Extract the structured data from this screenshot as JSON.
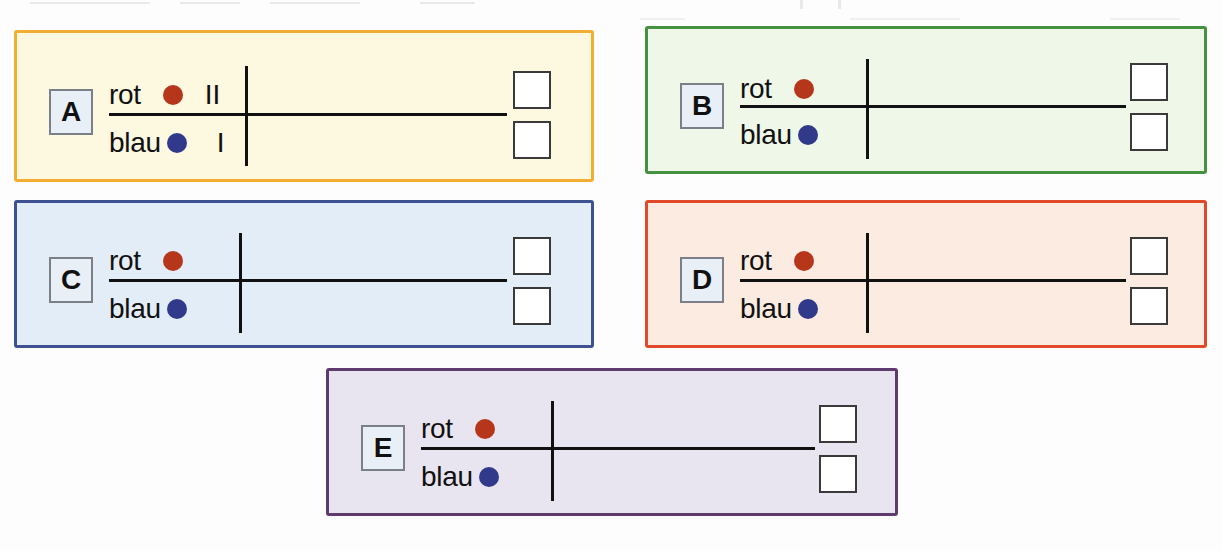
{
  "worksheet": {
    "row_labels": {
      "top": "rot",
      "bottom": "blau"
    },
    "dot_colors": {
      "red": "#b5361a",
      "blue": "#313a8a"
    },
    "panels": [
      {
        "id": "A",
        "letter": "A",
        "border_color": "#f1ae33",
        "fill_color": "#fdf8e0",
        "top_label": "rot",
        "bottom_label": "blau",
        "top_dot": "red",
        "bottom_dot": "blue",
        "top_numeral": "II",
        "bottom_numeral": "I",
        "checkbox_count": 2
      },
      {
        "id": "B",
        "letter": "B",
        "border_color": "#44913f",
        "fill_color": "#eef7e8",
        "top_label": "rot",
        "bottom_label": "blau",
        "top_dot": "red",
        "bottom_dot": "blue",
        "top_numeral": "",
        "bottom_numeral": "",
        "checkbox_count": 2
      },
      {
        "id": "C",
        "letter": "C",
        "border_color": "#3e5190",
        "fill_color": "#e3edf7",
        "top_label": "rot",
        "bottom_label": "blau",
        "top_dot": "red",
        "bottom_dot": "blue",
        "top_numeral": "",
        "bottom_numeral": "",
        "checkbox_count": 2
      },
      {
        "id": "D",
        "letter": "D",
        "border_color": "#e04a28",
        "fill_color": "#fcebe0",
        "top_label": "rot",
        "bottom_label": "blau",
        "top_dot": "red",
        "bottom_dot": "blue",
        "top_numeral": "",
        "bottom_numeral": "",
        "checkbox_count": 2
      },
      {
        "id": "E",
        "letter": "E",
        "border_color": "#5e3a6e",
        "fill_color": "#e9e5f0",
        "top_label": "rot",
        "bottom_label": "blau",
        "top_dot": "red",
        "bottom_dot": "blue",
        "top_numeral": "",
        "bottom_numeral": "",
        "checkbox_count": 2
      }
    ]
  }
}
